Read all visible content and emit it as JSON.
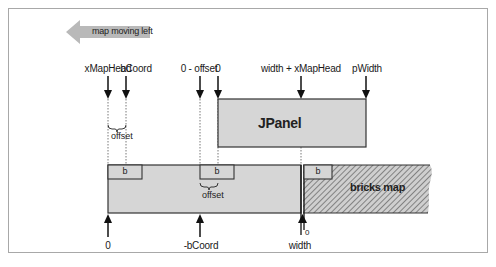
{
  "diagram": {
    "direction_arrow": {
      "label": "map moving left",
      "color": "#b9b9b9"
    },
    "top_labels": [
      {
        "id": "xMapHead",
        "text": "xMapHead",
        "x": 108
      },
      {
        "id": "bCoord",
        "text": "bCoord",
        "x": 126
      },
      {
        "id": "zero-minus-offset",
        "text": "0 - offset",
        "x": 200
      },
      {
        "id": "zero",
        "text": "0",
        "x": 218
      },
      {
        "id": "width-plus-xMapHead",
        "text": "width + xMapHead",
        "x": 301
      },
      {
        "id": "pWidth",
        "text": "pWidth",
        "x": 366
      }
    ],
    "jpanel": {
      "label": "JPanel",
      "fill": "#d6d6d6"
    },
    "bricks_map": {
      "label": "bricks map",
      "fill": "#d6d6d6",
      "hatch_color": "#6e6e6e"
    },
    "brick_boxes": [
      {
        "label": "b",
        "x": 108
      },
      {
        "label": "b",
        "x": 200
      },
      {
        "label": "b",
        "x": 304
      }
    ],
    "offset_labels": [
      {
        "text": "offset",
        "position": "top"
      },
      {
        "text": "offset",
        "position": "middle"
      }
    ],
    "bottom_labels": [
      {
        "id": "zero-bottom",
        "text": "0",
        "x": 108
      },
      {
        "id": "neg-bCoord",
        "text": "-bCoord",
        "x": 200
      },
      {
        "id": "width",
        "text": "width",
        "x": 301
      },
      {
        "id": "zero-small",
        "text": "0",
        "x": 306
      }
    ]
  }
}
